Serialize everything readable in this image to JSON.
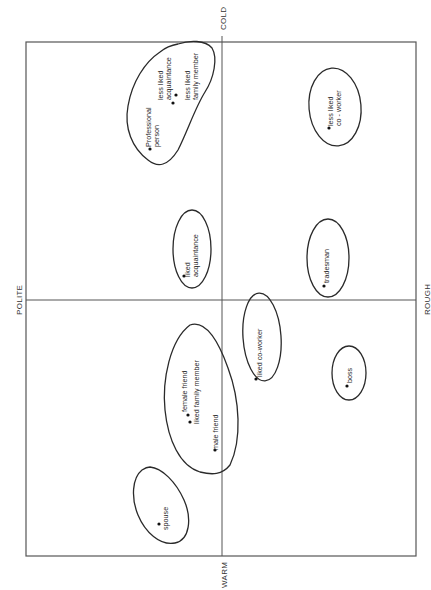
{
  "diagram": {
    "type": "perceptual-map",
    "axes": {
      "top": "COLD",
      "bottom": "WARM",
      "left": "POLITE",
      "right": "ROUGH"
    },
    "clusters": [
      {
        "id": "formal-cluster",
        "items": [
          {
            "label_lines": [
              "Professional",
              "person"
            ]
          },
          {
            "label_lines": [
              "less liked",
              "acquaintance"
            ]
          },
          {
            "label_lines": [
              "less liked",
              "family member"
            ]
          }
        ]
      },
      {
        "id": "less-liked-coworker-cluster",
        "items": [
          {
            "label_lines": [
              "less liked",
              "co - worker"
            ]
          }
        ]
      },
      {
        "id": "liked-acquaintance-cluster",
        "items": [
          {
            "label_lines": [
              "liked",
              "acquaintance"
            ]
          }
        ]
      },
      {
        "id": "tradesman-cluster",
        "items": [
          {
            "label_lines": [
              "tradesman"
            ]
          }
        ]
      },
      {
        "id": "friends-cluster",
        "items": [
          {
            "label_lines": [
              "female friend"
            ]
          },
          {
            "label_lines": [
              "liked family member"
            ]
          },
          {
            "label_lines": [
              "male friend"
            ]
          }
        ]
      },
      {
        "id": "liked-coworker-cluster",
        "items": [
          {
            "label_lines": [
              "liked co-worker"
            ]
          }
        ]
      },
      {
        "id": "boss-cluster",
        "items": [
          {
            "label_lines": [
              "boss"
            ]
          }
        ]
      },
      {
        "id": "spouse-cluster",
        "items": [
          {
            "label_lines": [
              "spouse"
            ]
          }
        ]
      }
    ]
  }
}
